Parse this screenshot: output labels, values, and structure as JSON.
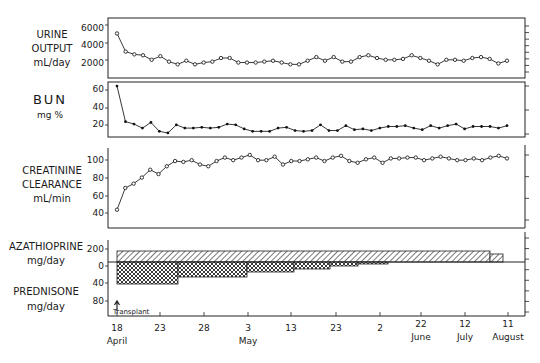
{
  "chart_data": [
    {
      "type": "line",
      "panel": "urine-output",
      "ylabel_lines": [
        "URINE",
        "OUTPUT",
        "mL/day"
      ],
      "yticks": [
        2000,
        4000,
        6000
      ],
      "ylim": [
        0,
        6600
      ],
      "marker": "open-circle",
      "values": [
        4900,
        2900,
        2600,
        2500,
        2000,
        2400,
        1800,
        1500,
        1900,
        1500,
        1700,
        1800,
        2200,
        2200,
        1700,
        1700,
        1700,
        1800,
        1900,
        1700,
        1500,
        1500,
        1900,
        2300,
        1900,
        2300,
        1800,
        1800,
        2300,
        2500,
        2200,
        2000,
        2000,
        2100,
        2500,
        2200,
        1900,
        1500,
        2000,
        2000,
        1900,
        2200,
        2300,
        2100,
        1600,
        1900
      ]
    },
    {
      "type": "line",
      "panel": "bun",
      "ylabel_lines": [
        "BUN",
        "mg %"
      ],
      "yticks": [
        20,
        40,
        60
      ],
      "ylim": [
        0,
        66
      ],
      "marker": "filled-dot",
      "values": [
        63,
        19,
        16,
        11,
        18,
        7,
        5,
        15,
        11,
        11,
        12,
        11,
        12,
        16,
        15,
        10,
        7,
        7,
        7,
        11,
        12,
        8,
        7,
        8,
        15,
        8,
        8,
        14,
        9,
        10,
        8,
        11,
        13,
        13,
        14,
        11,
        9,
        14,
        11,
        14,
        16,
        10,
        13,
        13,
        13,
        11,
        14
      ]
    },
    {
      "type": "line",
      "panel": "creatinine-clearance",
      "ylabel_lines": [
        "CREATININE",
        "CLEARANCE",
        "mL/min"
      ],
      "yticks": [
        40,
        60,
        80,
        100
      ],
      "ylim": [
        20,
        110
      ],
      "marker": "open-circle",
      "values": [
        41,
        66,
        71,
        78,
        87,
        82,
        91,
        97,
        96,
        98,
        93,
        91,
        97,
        101,
        98,
        101,
        104,
        98,
        98,
        102,
        93,
        97,
        97,
        99,
        101,
        97,
        101,
        103,
        97,
        95,
        99,
        101,
        95,
        100,
        100,
        101,
        101,
        98,
        100,
        102,
        100,
        98,
        98,
        100,
        98,
        101,
        103,
        100
      ]
    },
    {
      "type": "area",
      "panel": "immunosuppression",
      "ylabel_top": [
        "AZATHIOPRINE",
        "mg/day"
      ],
      "ylabel_bottom": [
        "PREDNISONE",
        "mg/day"
      ],
      "yticks_top": [
        0,
        200
      ],
      "yticks_bottom": [
        40,
        80
      ],
      "series": [
        {
          "name": "Azathioprine",
          "pattern": "diagonal-hatch",
          "direction": "up",
          "steps": [
            {
              "from": "Apr 18",
              "to": "Jul 18",
              "value": 150
            },
            {
              "from": "Jul 18",
              "to": "Aug 11",
              "value": 120
            }
          ]
        },
        {
          "name": "Prednisone",
          "pattern": "cross-hatch",
          "direction": "down",
          "steps": [
            {
              "from": "Apr 18",
              "to": "Apr 25",
              "value": 60
            },
            {
              "from": "Apr 25",
              "to": "May 3",
              "value": 40
            },
            {
              "from": "May 3",
              "to": "May 13",
              "value": 25
            },
            {
              "from": "May 13",
              "to": "May 21",
              "value": 15
            },
            {
              "from": "May 21",
              "to": "May 28",
              "value": 10
            },
            {
              "from": "May 28",
              "to": "Jun 3",
              "value": 5
            }
          ]
        }
      ],
      "annotation": "Transplant"
    }
  ],
  "xaxis": {
    "ticks": [
      {
        "day": "18",
        "month": "April"
      },
      {
        "day": "23",
        "month": ""
      },
      {
        "day": "28",
        "month": ""
      },
      {
        "day": "3",
        "month": "May"
      },
      {
        "day": "13",
        "month": ""
      },
      {
        "day": "23",
        "month": ""
      },
      {
        "day": "2",
        "month": ""
      },
      {
        "day": "22",
        "month": "June"
      },
      {
        "day": "12",
        "month": "July"
      },
      {
        "day": "11",
        "month": "August"
      }
    ]
  },
  "labels": {
    "urine": [
      "URINE",
      "OUTPUT",
      "mL/day"
    ],
    "bun": [
      "BUN",
      "mg %"
    ],
    "creat": [
      "CREATININE",
      "CLEARANCE",
      "mL/min"
    ],
    "aza": [
      "AZATHIOPRINE",
      "mg/day"
    ],
    "pred": [
      "PREDNISONE",
      "mg/day"
    ],
    "transplant": "Transplant",
    "urine_ticks": [
      "6000",
      "4000",
      "2000"
    ],
    "bun_ticks": [
      "60",
      "40",
      "20"
    ],
    "creat_ticks": [
      "100",
      "80",
      "60",
      "40"
    ],
    "drug_ticks": [
      "200",
      "0",
      "40",
      "80"
    ]
  }
}
